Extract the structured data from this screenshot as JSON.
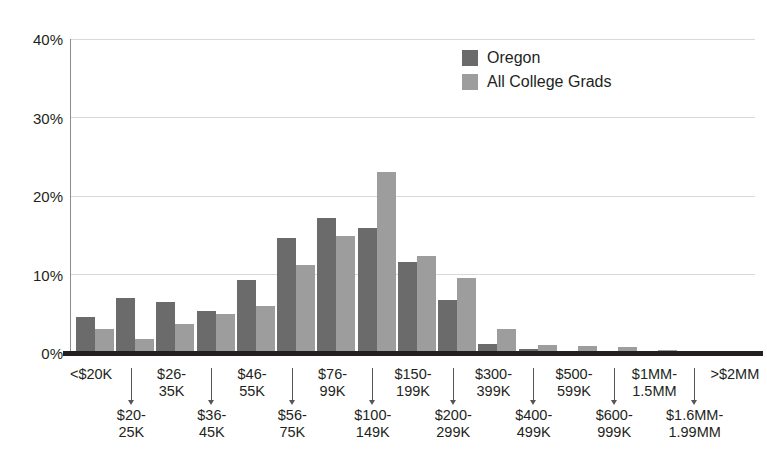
{
  "chart_data": {
    "type": "bar",
    "title": "",
    "subtitle": "",
    "xlabel": "",
    "ylabel": "",
    "ylim": [
      0,
      40
    ],
    "yticks": [
      "0%",
      "10%",
      "20%",
      "30%",
      "40%"
    ],
    "ytick_values": [
      0,
      10,
      20,
      30,
      40
    ],
    "grid": true,
    "legend_position": "top-center-right",
    "categories": [
      "<$20K",
      "$20-\n25K",
      "$26-\n35K",
      "$36-\n45K",
      "$46-\n55K",
      "$56-\n75K",
      "$76-\n99K",
      "$100-\n149K",
      "$150-\n199K",
      "$200-\n299K",
      "$300-\n399K",
      "$400-\n499K",
      "$500-\n599K",
      "$600-\n999K",
      "$1MM-\n1.5MM",
      "$1.6MM-\n1.99MM",
      ">$2MM"
    ],
    "category_labels": [
      {
        "line1": "<$20K",
        "line2": "",
        "row": "top"
      },
      {
        "line1": "$20-",
        "line2": "25K",
        "row": "bottom"
      },
      {
        "line1": "$26-",
        "line2": "35K",
        "row": "top"
      },
      {
        "line1": "$36-",
        "line2": "45K",
        "row": "bottom"
      },
      {
        "line1": "$46-",
        "line2": "55K",
        "row": "top"
      },
      {
        "line1": "$56-",
        "line2": "75K",
        "row": "bottom"
      },
      {
        "line1": "$76-",
        "line2": "99K",
        "row": "top"
      },
      {
        "line1": "$100-",
        "line2": "149K",
        "row": "bottom"
      },
      {
        "line1": "$150-",
        "line2": "199K",
        "row": "top"
      },
      {
        "line1": "$200-",
        "line2": "299K",
        "row": "bottom"
      },
      {
        "line1": "$300-",
        "line2": "399K",
        "row": "top"
      },
      {
        "line1": "$400-",
        "line2": "499K",
        "row": "bottom"
      },
      {
        "line1": "$500-",
        "line2": "599K",
        "row": "top"
      },
      {
        "line1": "$600-",
        "line2": "999K",
        "row": "bottom"
      },
      {
        "line1": "$1MM-",
        "line2": "1.5MM",
        "row": "top"
      },
      {
        "line1": "$1.6MM-",
        "line2": "1.99MM",
        "row": "bottom"
      },
      {
        "line1": ">$2MM",
        "line2": "",
        "row": "top"
      }
    ],
    "series": [
      {
        "name": "Oregon",
        "color": "#6b6b6b",
        "values": [
          4.6,
          7.0,
          6.5,
          5.4,
          9.3,
          14.7,
          17.2,
          15.9,
          11.6,
          6.7,
          1.2,
          0.5,
          0.2,
          0.2,
          0.1,
          0.1,
          0.1
        ]
      },
      {
        "name": "All College Grads",
        "color": "#9d9d9d",
        "values": [
          3.0,
          1.8,
          3.7,
          5.0,
          6.0,
          11.2,
          14.9,
          23.0,
          12.4,
          9.5,
          3.0,
          1.0,
          0.9,
          0.8,
          0.4,
          0.2,
          0.2
        ]
      }
    ]
  },
  "legend": {
    "items": [
      {
        "label": "Oregon",
        "color": "#6b6b6b"
      },
      {
        "label": "All College Grads",
        "color": "#9d9d9d"
      }
    ]
  },
  "axis": {
    "y_ticks": [
      "40%",
      "30%",
      "20%",
      "10%",
      "0%"
    ]
  }
}
